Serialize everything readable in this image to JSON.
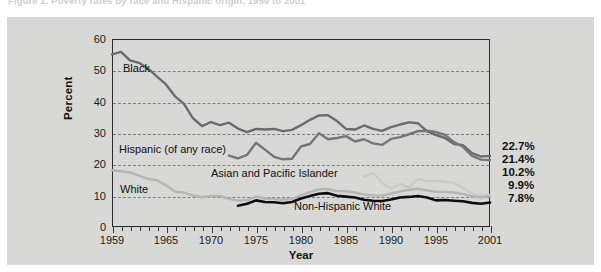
{
  "figure": {
    "caption": "Figure 1. Poverty rates by race and Hispanic origin, 1959 to 2001"
  },
  "chart_data": {
    "type": "line",
    "title": "Poverty rates by race and Hispanic origin, 1959 to 2001",
    "xlabel": "Year",
    "ylabel": "Percent",
    "xlim": [
      1959,
      2001
    ],
    "ylim": [
      0,
      60
    ],
    "yticks": [
      0,
      10,
      20,
      30,
      40,
      50,
      60
    ],
    "xticks": [
      1959,
      1965,
      1970,
      1975,
      1980,
      1985,
      1990,
      1995,
      2001
    ],
    "grid": "horizontal-dashed",
    "legend": "inline-labels",
    "series": [
      {
        "name": "Black",
        "color": "#6b6b6b",
        "end_label": "22.7%",
        "end_value": 22.7,
        "x": [
          1959,
          1960,
          1961,
          1962,
          1963,
          1964,
          1965,
          1966,
          1967,
          1968,
          1969,
          1970,
          1971,
          1972,
          1973,
          1974,
          1975,
          1976,
          1977,
          1978,
          1979,
          1980,
          1981,
          1982,
          1983,
          1984,
          1985,
          1986,
          1987,
          1988,
          1989,
          1990,
          1991,
          1992,
          1993,
          1994,
          1995,
          1996,
          1997,
          1998,
          1999,
          2000,
          2001
        ],
        "values": [
          55.1,
          55.9,
          53.2,
          52.4,
          50.6,
          48.0,
          45.5,
          41.7,
          39.3,
          34.7,
          32.2,
          33.5,
          32.5,
          33.3,
          31.4,
          30.3,
          31.3,
          31.1,
          31.3,
          30.6,
          31.0,
          32.5,
          34.2,
          35.6,
          35.7,
          33.8,
          31.3,
          31.1,
          32.4,
          31.3,
          30.7,
          31.9,
          32.7,
          33.4,
          33.1,
          30.6,
          29.3,
          28.4,
          26.5,
          26.1,
          23.6,
          22.5,
          22.7
        ]
      },
      {
        "name": "Hispanic (of any race)",
        "color": "#767676",
        "end_label": "21.4%",
        "end_value": 21.4,
        "x": [
          1972,
          1973,
          1974,
          1975,
          1976,
          1977,
          1978,
          1979,
          1980,
          1981,
          1982,
          1983,
          1984,
          1985,
          1986,
          1987,
          1988,
          1989,
          1990,
          1991,
          1992,
          1993,
          1994,
          1995,
          1996,
          1997,
          1998,
          1999,
          2000,
          2001
        ],
        "values": [
          22.8,
          21.9,
          23.0,
          26.9,
          24.7,
          22.4,
          21.6,
          21.8,
          25.7,
          26.5,
          29.9,
          28.0,
          28.4,
          29.0,
          27.3,
          28.0,
          26.7,
          26.2,
          28.1,
          28.7,
          29.6,
          30.6,
          30.7,
          30.3,
          29.4,
          27.1,
          25.6,
          22.7,
          21.5,
          21.4
        ]
      },
      {
        "name": "Asian and Pacific Islander",
        "color": "#c9c9c7",
        "end_label": "10.2%",
        "end_value": 10.2,
        "x": [
          1987,
          1988,
          1989,
          1990,
          1991,
          1992,
          1993,
          1994,
          1995,
          1996,
          1997,
          1998,
          1999,
          2000,
          2001
        ],
        "values": [
          16.1,
          17.3,
          14.1,
          12.2,
          13.8,
          12.7,
          15.3,
          14.6,
          14.6,
          14.5,
          14.0,
          12.5,
          10.7,
          9.9,
          10.2
        ]
      },
      {
        "name": "White",
        "color": "#b5b5b3",
        "end_label": "9.9%",
        "end_value": 9.9,
        "x": [
          1959,
          1960,
          1961,
          1962,
          1963,
          1964,
          1965,
          1966,
          1967,
          1968,
          1969,
          1970,
          1971,
          1972,
          1973,
          1974,
          1975,
          1976,
          1977,
          1978,
          1979,
          1980,
          1981,
          1982,
          1983,
          1984,
          1985,
          1986,
          1987,
          1988,
          1989,
          1990,
          1991,
          1992,
          1993,
          1994,
          1995,
          1996,
          1997,
          1998,
          1999,
          2000,
          2001
        ],
        "values": [
          18.1,
          17.8,
          17.4,
          16.4,
          15.3,
          14.9,
          13.3,
          11.3,
          11.0,
          10.0,
          9.5,
          9.9,
          9.9,
          9.0,
          8.4,
          8.6,
          9.7,
          9.1,
          8.9,
          8.7,
          9.0,
          10.2,
          11.1,
          12.0,
          12.1,
          11.5,
          11.4,
          11.0,
          10.4,
          10.1,
          10.0,
          10.7,
          11.3,
          11.9,
          12.2,
          11.7,
          11.2,
          11.2,
          11.0,
          10.5,
          9.8,
          9.4,
          9.9
        ]
      },
      {
        "name": "Non-Hispanic White",
        "color": "#0d0d0d",
        "end_label": "7.8%",
        "end_value": 7.8,
        "x": [
          1973,
          1974,
          1975,
          1976,
          1977,
          1978,
          1979,
          1980,
          1981,
          1982,
          1983,
          1984,
          1985,
          1986,
          1987,
          1988,
          1989,
          1990,
          1991,
          1992,
          1993,
          1994,
          1995,
          1996,
          1997,
          1998,
          1999,
          2000,
          2001
        ],
        "values": [
          6.8,
          7.4,
          8.5,
          8.0,
          7.9,
          7.6,
          8.0,
          9.1,
          9.9,
          10.6,
          10.8,
          10.0,
          9.7,
          9.4,
          8.7,
          8.4,
          8.3,
          8.8,
          9.4,
          9.6,
          9.9,
          9.4,
          8.5,
          8.6,
          8.4,
          8.2,
          7.7,
          7.4,
          7.8
        ]
      }
    ],
    "inline_labels": [
      {
        "text": "Black",
        "x": 123,
        "y": 62
      },
      {
        "text": "Hispanic (of any race)",
        "x": 119,
        "y": 143
      },
      {
        "text": "Asian and Pacific Islander",
        "x": 211,
        "y": 167
      },
      {
        "text": "White",
        "x": 120,
        "y": 183
      },
      {
        "text": "Non-Hispanic White",
        "x": 294,
        "y": 200
      }
    ],
    "end_labels": [
      {
        "text": "22.7%",
        "y": 146
      },
      {
        "text": "21.4%",
        "y": 159
      },
      {
        "text": "10.2%",
        "y": 172
      },
      {
        "text": "9.9%",
        "y": 185
      },
      {
        "text": "7.8%",
        "y": 198
      }
    ]
  },
  "axes": {
    "y_ticks": [
      "60",
      "50",
      "40",
      "30",
      "20",
      "10",
      "0"
    ],
    "y_label": "Percent",
    "x_ticks": [
      "1959",
      "1965",
      "1970",
      "1975",
      "1980",
      "1985",
      "1990",
      "1995",
      "2001"
    ],
    "x_label": "Year"
  }
}
